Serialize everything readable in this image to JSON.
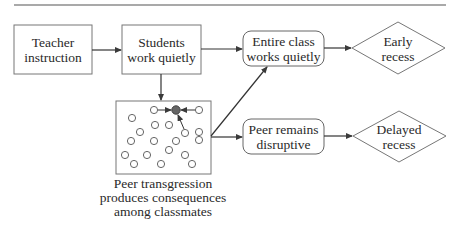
{
  "diagram": {
    "nodes": {
      "teacher": {
        "line1": "Teacher",
        "line2": "instruction",
        "shape": "rectangle"
      },
      "students": {
        "line1": "Students",
        "line2": "work quietly",
        "shape": "rectangle"
      },
      "entire_class": {
        "line1": "Entire class",
        "line2": "works quietly",
        "shape": "rounded-rectangle"
      },
      "early_recess": {
        "line1": "Early",
        "line2": "recess",
        "shape": "diamond"
      },
      "peer_remains": {
        "line1": "Peer remains",
        "line2": "disruptive",
        "shape": "rounded-rectangle"
      },
      "delayed_recess": {
        "line1": "Delayed",
        "line2": "recess",
        "shape": "diamond"
      },
      "classroom": {
        "shape": "rectangle-with-circles",
        "caption_line1": "Peer transgression",
        "caption_line2": "produces consequences",
        "caption_line3": "among classmates"
      }
    },
    "edges": [
      {
        "from": "teacher",
        "to": "students"
      },
      {
        "from": "students",
        "to": "entire_class"
      },
      {
        "from": "students",
        "to": "classroom"
      },
      {
        "from": "classroom",
        "to": "entire_class"
      },
      {
        "from": "classroom",
        "to": "peer_remains"
      },
      {
        "from": "entire_class",
        "to": "early_recess"
      },
      {
        "from": "peer_remains",
        "to": "delayed_recess"
      }
    ],
    "colors": {
      "stroke": "#6b6b6b",
      "text": "#2a2a2a",
      "highlight_circle": "#666666"
    }
  }
}
